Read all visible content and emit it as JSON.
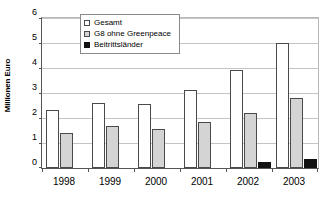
{
  "chart_data": {
    "type": "bar",
    "title": "",
    "subtitle": "",
    "xlabel": "",
    "ylabel": "Millionen Euro",
    "categories": [
      "1998",
      "1999",
      "2000",
      "2001",
      "2002",
      "2003"
    ],
    "series": [
      {
        "name": "Gesamt",
        "color": "#ffffff",
        "values": [
          2.33,
          2.62,
          2.58,
          3.12,
          3.93,
          5.0
        ]
      },
      {
        "name": "G8 ohne Greenpeace",
        "color": "#d4d4d4",
        "values": [
          1.4,
          1.67,
          1.58,
          1.85,
          2.2,
          2.8
        ]
      },
      {
        "name": "Beitrittsländer",
        "color": "#111111",
        "values": [
          0,
          0,
          0,
          0,
          0.25,
          0.35
        ]
      }
    ],
    "ylim": [
      0,
      6
    ],
    "yticks": [
      "0",
      "1",
      "2",
      "3",
      "4",
      "5",
      "6"
    ],
    "grid": true,
    "legend_position": "top-left-inside"
  },
  "legend": {
    "items": [
      {
        "label": "Gesamt",
        "swatch": "open-square-swatch"
      },
      {
        "label": "G8 ohne Greenpeace",
        "swatch": "gray-square-swatch"
      },
      {
        "label": "Beitrittsländer",
        "swatch": "black-square-swatch"
      }
    ]
  },
  "axes": {
    "y_title": "Millionen Euro",
    "y_ticks": [
      "6",
      "5",
      "4",
      "3",
      "2",
      "1",
      "0"
    ],
    "x_ticks": [
      "1998",
      "1999",
      "2000",
      "2001",
      "2002",
      "2003"
    ]
  }
}
